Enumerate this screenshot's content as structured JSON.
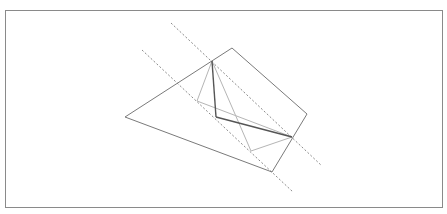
{
  "diagram": {
    "type": "geometry-construction",
    "frame": {
      "x": 5,
      "y": 10,
      "w": 438,
      "h": 198,
      "stroke": "#8a8a8a"
    },
    "colors": {
      "outline": "#7a7a7a",
      "dark": "#555555",
      "light": "#b5b5b5",
      "dashed": "#8a8a8a"
    },
    "quadrilateral": [
      [
        125,
        117
      ],
      [
        232,
        48
      ],
      [
        307,
        114
      ],
      [
        272,
        172
      ]
    ],
    "points": {
      "apex": [
        212,
        61
      ],
      "inner_left": [
        197,
        101
      ],
      "inner_corner": [
        216,
        117
      ],
      "right_edge": [
        292,
        137
      ],
      "inner_bottom": [
        251,
        151
      ]
    },
    "dashed_lines": [
      {
        "from": [
          171,
          23
        ],
        "to": [
          322,
          166
        ]
      },
      {
        "from": [
          142,
          50
        ],
        "to": [
          293,
          192
        ]
      }
    ],
    "segments_dark": [
      {
        "from": [
          212,
          61
        ],
        "to": [
          216,
          117
        ]
      },
      {
        "from": [
          216,
          117
        ],
        "to": [
          292,
          137
        ]
      }
    ],
    "segments_light": [
      {
        "from": [
          212,
          61
        ],
        "to": [
          197,
          101
        ]
      },
      {
        "from": [
          197,
          101
        ],
        "to": [
          292,
          137
        ]
      },
      {
        "from": [
          212,
          61
        ],
        "to": [
          251,
          151
        ]
      },
      {
        "from": [
          251,
          151
        ],
        "to": [
          292,
          137
        ]
      }
    ]
  }
}
